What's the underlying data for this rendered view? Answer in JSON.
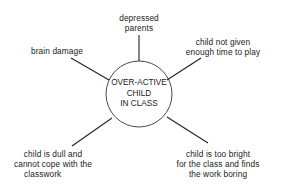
{
  "diagram": {
    "type": "spider-diagram",
    "center": {
      "lines": [
        "OVER-ACTIVE",
        "CHILD",
        "IN CLASS"
      ]
    },
    "branches": [
      {
        "id": "depressed-parents",
        "lines": [
          "depressed",
          "parents"
        ]
      },
      {
        "id": "brain-damage",
        "lines": [
          "brain damage"
        ]
      },
      {
        "id": "not-enough-play",
        "lines": [
          "child not given",
          "enough time to play"
        ]
      },
      {
        "id": "dull",
        "lines": [
          "child is dull and",
          "cannot cope with the",
          "classwork"
        ]
      },
      {
        "id": "too-bright",
        "lines": [
          "child is too bright",
          "for the class and finds",
          "the work boring"
        ]
      }
    ]
  }
}
